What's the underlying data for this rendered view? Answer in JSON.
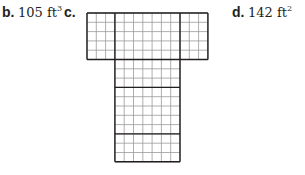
{
  "options": [
    {
      "letter": "b.",
      "value": "105 ft",
      "exponent": "3"
    },
    {
      "letter": "c.",
      "value": "",
      "exponent": ""
    },
    {
      "letter": "d.",
      "value": "142 ft",
      "exponent": "2"
    }
  ],
  "net": {
    "description": "Net of a rectangular prism drawn on grid paper",
    "cell_size_px": 9.3,
    "top_band": {
      "x": 87,
      "y": 13,
      "cols": 13,
      "rows": 5,
      "col_divisions": [
        3,
        7,
        3
      ]
    },
    "stem": {
      "x": 115,
      "y": 62,
      "cols": 7,
      "rows": 11,
      "row_divisions": [
        3,
        5,
        3
      ]
    },
    "colors": {
      "grid_line": "#9a9a9a",
      "face_line": "#231f20"
    }
  }
}
